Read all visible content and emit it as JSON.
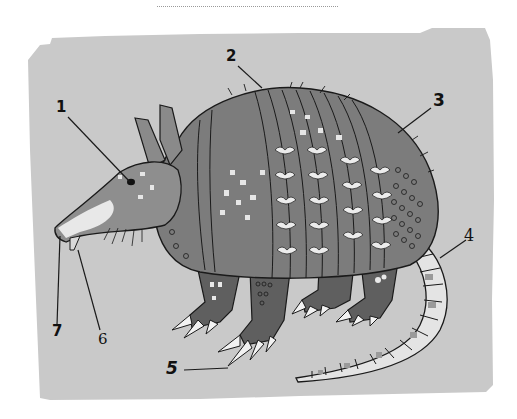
{
  "diagram": {
    "colors": {
      "background_panel": "#c9c9c9",
      "body_shell": "#7c7c7c",
      "shell_dark": "#6a6a6a",
      "legs": "#5f5f5f",
      "light_spots": "#e9e9e9",
      "outline": "#1a1a1a",
      "label_text": "#111111"
    },
    "labels": [
      {
        "id": "1",
        "text": "1",
        "x": 56,
        "y": 96,
        "target": [
          130,
          182
        ]
      },
      {
        "id": "2",
        "text": "2",
        "x": 226,
        "y": 49,
        "target": [
          262,
          88
        ]
      },
      {
        "id": "3",
        "text": "3",
        "x": 433,
        "y": 93,
        "target": [
          398,
          132
        ]
      },
      {
        "id": "4",
        "text": "4",
        "x": 465,
        "y": 233,
        "target": [
          442,
          258
        ]
      },
      {
        "id": "5",
        "text": "5",
        "x": 166,
        "y": 361,
        "target": [
          228,
          368
        ]
      },
      {
        "id": "6",
        "text": "6",
        "x": 100,
        "y": 335,
        "target": [
          78,
          248
        ]
      },
      {
        "id": "7",
        "text": "7",
        "x": 52,
        "y": 327,
        "target": [
          60,
          234
        ]
      }
    ]
  }
}
